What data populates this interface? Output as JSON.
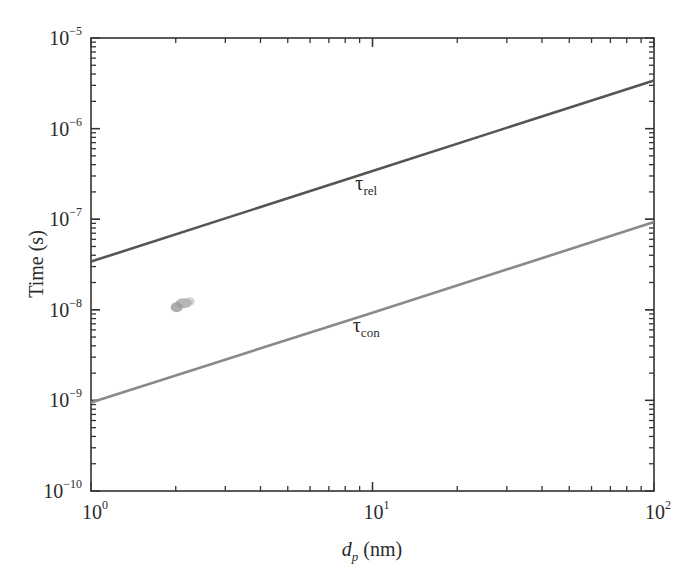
{
  "chart_data": {
    "type": "line",
    "title": "",
    "xlabel": "d_p (nm)",
    "xlabel_parts": {
      "main": "d",
      "sub": "p",
      "unit": " (nm)"
    },
    "ylabel": "Time (s)",
    "xscale": "log",
    "yscale": "log",
    "xlim": [
      1,
      100
    ],
    "ylim": [
      1e-10,
      1e-05
    ],
    "grid": false,
    "legend": "none (inline labels)",
    "x_ticks": [
      {
        "value": 1,
        "base": "10",
        "exp": "0"
      },
      {
        "value": 10,
        "base": "10",
        "exp": "1"
      },
      {
        "value": 100,
        "base": "10",
        "exp": "2"
      }
    ],
    "y_ticks": [
      {
        "value": 1e-05,
        "base": "10",
        "exp": "−5"
      },
      {
        "value": 1e-06,
        "base": "10",
        "exp": "−6"
      },
      {
        "value": 1e-07,
        "base": "10",
        "exp": "−7"
      },
      {
        "value": 1e-08,
        "base": "10",
        "exp": "−8"
      },
      {
        "value": 1e-09,
        "base": "10",
        "exp": "−9"
      },
      {
        "value": 1e-10,
        "base": "10",
        "exp": "−10"
      }
    ],
    "series": [
      {
        "name": "τ_rel",
        "label_main": "τ",
        "label_sub": "rel",
        "color": "#555555",
        "x": [
          1,
          10,
          100
        ],
        "y": [
          3.4e-08,
          3.4e-07,
          3.4e-06
        ],
        "label_at": [
          9.5,
          2.6e-07
        ]
      },
      {
        "name": "τ_con",
        "label_main": "τ",
        "label_sub": "con",
        "color": "#8a8a8a",
        "x": [
          1,
          10,
          100
        ],
        "y": [
          9.5e-10,
          9.3e-09,
          9.3e-08
        ],
        "label_at": [
          9.5,
          7e-09
        ]
      }
    ],
    "annotations": [
      {
        "type": "smudge",
        "x": 2.1,
        "y": 1.15e-08,
        "color": "#777777"
      }
    ]
  }
}
